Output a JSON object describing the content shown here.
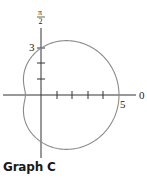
{
  "caption": "Graph C",
  "chart_data": {
    "type": "polar",
    "equation_implied": "r = 3 + 2cos(theta)",
    "curve": "limacon",
    "key_points": [
      {
        "theta": "0",
        "r": 5
      },
      {
        "theta": "pi/2",
        "r": 3
      },
      {
        "theta": "pi",
        "r": 1
      },
      {
        "theta": "3pi/2",
        "r": 3
      }
    ],
    "labels": {
      "polar_axis": "0",
      "vertical_axis_num": "π",
      "vertical_axis_den": "2",
      "x_tick_label": "5",
      "y_tick_label": "3"
    },
    "x_ticks": [
      1,
      2,
      3,
      4,
      5
    ],
    "y_ticks": [
      1,
      2,
      3
    ],
    "curve_color": "#8a8a8a",
    "axis_color": "#333333"
  }
}
